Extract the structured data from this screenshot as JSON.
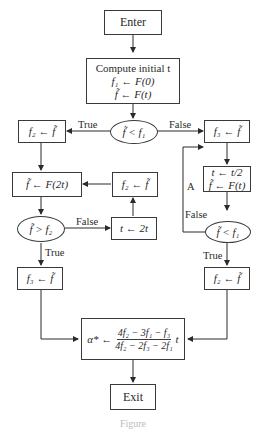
{
  "diagram": {
    "type": "flowchart",
    "nodes": {
      "enter": {
        "label": "Enter"
      },
      "compute": {
        "line1": "Compute initial t",
        "line2": "f₁ ← F(0)",
        "line3": "f̃ ← F(t)"
      },
      "decision1": {
        "label": "f̃ < f₁"
      },
      "left_f2": {
        "label": "f₂ ← f̃"
      },
      "left_F2t": {
        "label": "f̃ ← F(2t)"
      },
      "mid_f2": {
        "label": "f₂ ← f̃"
      },
      "decision2": {
        "label": "f̃ > f₂"
      },
      "double_t": {
        "label": "t ← 2t"
      },
      "left_f3": {
        "label": "f₃ ← f̃"
      },
      "right_f3": {
        "label": "f₃ ← f̃"
      },
      "halve": {
        "line1": "t ← t/2",
        "line2": "f̃ ← F(t)"
      },
      "decision3": {
        "label": "f̃ < f₁"
      },
      "right_f2": {
        "label": "f₂ ← f̃"
      },
      "alpha": {
        "prefix": "α* ←",
        "numerator": "4f₂ − 3f₁ − f₃",
        "denominator": "4f₂ − 2f₃ − 2f₁",
        "suffix": "t"
      },
      "exit": {
        "label": "Exit"
      }
    },
    "edge_labels": {
      "d1_true": "True",
      "d1_false": "False",
      "d2_false": "False",
      "d2_true": "True",
      "d3_false": "False",
      "d3_true": "True",
      "loop_a": "A"
    },
    "caption": "Figure"
  }
}
